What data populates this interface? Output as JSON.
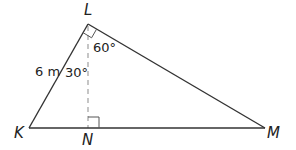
{
  "diagram": {
    "type": "right-triangle-with-altitude",
    "vertices": {
      "L": {
        "label": "L",
        "x": 88,
        "y": 24
      },
      "K": {
        "label": "K",
        "x": 29,
        "y": 128
      },
      "N": {
        "label": "N",
        "x": 88,
        "y": 128
      },
      "M": {
        "label": "M",
        "x": 265,
        "y": 128
      }
    },
    "segments": [
      {
        "from": "K",
        "to": "L",
        "style": "solid",
        "label": "6 m"
      },
      {
        "from": "L",
        "to": "M",
        "style": "solid"
      },
      {
        "from": "K",
        "to": "M",
        "style": "solid"
      },
      {
        "from": "L",
        "to": "N",
        "style": "dashed"
      }
    ],
    "angle_labels": {
      "kln": "30°",
      "nlm": "60°"
    },
    "side_labels": {
      "kl": "6 m"
    },
    "right_angle_marks": [
      "L",
      "N"
    ],
    "colors": {
      "line": "#333333",
      "dashed": "#999999",
      "text": "#222222"
    }
  }
}
